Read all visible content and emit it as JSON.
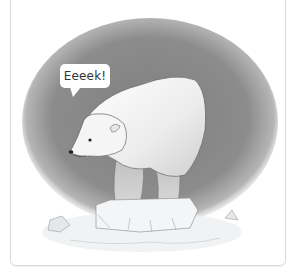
{
  "image": {
    "subject": "polar-bear-on-ice-floe",
    "speech_bubble": {
      "text": "Eeeek!"
    },
    "colors": {
      "background_wash": "#8a8a8a",
      "bear_fur": "#f2f2f2",
      "ice": "#e8ecee",
      "card_border": "#d9d9d9"
    }
  }
}
